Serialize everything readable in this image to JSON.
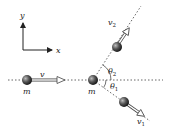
{
  "diagram": {
    "axes": {
      "x_label": "x",
      "y_label": "y"
    },
    "incoming": {
      "mass_label": "m",
      "velocity_label": "v"
    },
    "target": {
      "mass_label": "m"
    },
    "outgoing_upper": {
      "velocity_label": "v",
      "velocity_sub": "2",
      "angle_label": "θ",
      "angle_sub": "2"
    },
    "outgoing_lower": {
      "velocity_label": "v",
      "velocity_sub": "1",
      "angle_label": "θ",
      "angle_sub": "1"
    },
    "colors": {
      "line": "#333333",
      "ball_dark": "#1a1a1a",
      "ball_light": "#9a9a9a",
      "dashed": "#555555"
    }
  }
}
